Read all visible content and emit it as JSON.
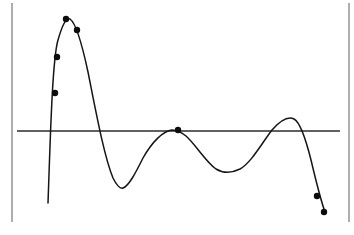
{
  "figure": {
    "title": "",
    "background_color": "#ffffff",
    "width": 354,
    "height": 235,
    "curve_color": "#151515",
    "axis_color": "#2b2b2b",
    "frame_color": "#9a9a9a",
    "marker_color": "#0d0d0d",
    "marker_radius": 3.2
  },
  "chart_data": {
    "type": "line",
    "title": "",
    "xlabel": "",
    "ylabel": "",
    "grid": false,
    "legend": null,
    "axis_line": {
      "orientation": "horizontal",
      "y": 131,
      "x_start": 17,
      "x_end": 340,
      "label": ""
    },
    "frame_rules": [
      {
        "orientation": "vertical",
        "x": 12,
        "y_start": 3,
        "y_end": 222
      },
      {
        "orientation": "vertical",
        "x": 349,
        "y_start": 3,
        "y_end": 222
      }
    ],
    "curve_path": "M 48 203 C 50 150 52 60 58 40 C 62 26 66 17 70 19 C 76 23 82 44 88 72 C 96 112 104 156 113 178 C 117 186 120 189 123 188 C 129 186 136 172 143 158 C 152 142 163 131 172 130 C 176 130 181 132 186 136 C 196 145 206 162 216 169 C 224 174 232 173 240 169 C 251 163 262 143 272 130 C 280 121 288 116 294 119 C 300 122 305 136 311 160 C 316 181 321 201 325 212",
    "curve_points": [
      {
        "x": 48,
        "y": 203,
        "role": "left-tail-start"
      },
      {
        "x": 68,
        "y": 19,
        "role": "peak-1"
      },
      {
        "x": 122,
        "y": 188,
        "role": "trough-1"
      },
      {
        "x": 178,
        "y": 130,
        "role": "axis-crossing"
      },
      {
        "x": 235,
        "y": 172,
        "role": "trough-2"
      },
      {
        "x": 292,
        "y": 118,
        "role": "peak-2"
      },
      {
        "x": 325,
        "y": 212,
        "role": "right-tail-end"
      }
    ],
    "markers": [
      {
        "x": 55,
        "y": 93,
        "label": ""
      },
      {
        "x": 57,
        "y": 57,
        "label": ""
      },
      {
        "x": 66,
        "y": 19,
        "label": ""
      },
      {
        "x": 77,
        "y": 30,
        "label": ""
      },
      {
        "x": 178,
        "y": 130,
        "label": ""
      },
      {
        "x": 317,
        "y": 196,
        "label": ""
      },
      {
        "x": 324,
        "y": 212,
        "label": ""
      }
    ]
  }
}
